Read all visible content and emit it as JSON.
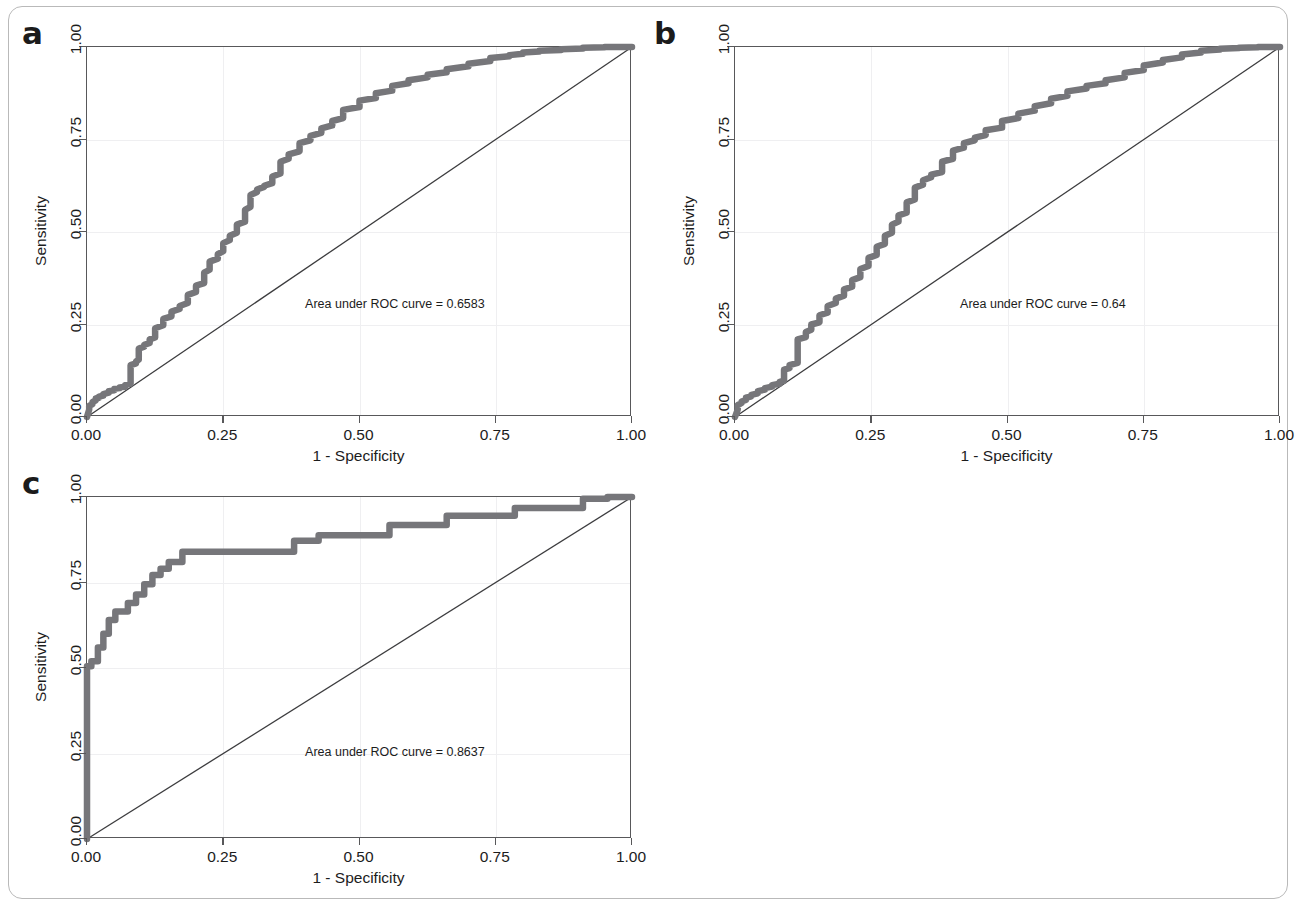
{
  "figure": {
    "panels": [
      {
        "label": "a",
        "auc_text": "Area under ROC curve = 0.6583",
        "auc_value": 0.6583,
        "xlabel": "1 - Specificity",
        "ylabel": "Sensitivity",
        "xticks": [
          "0.00",
          "0.25",
          "0.50",
          "0.75",
          "1.00"
        ],
        "yticks": [
          "0.00",
          "0.25",
          "0.50",
          "0.75",
          "1.00"
        ]
      },
      {
        "label": "b",
        "auc_text": "Area under ROC curve = 0.64",
        "auc_value": 0.64,
        "xlabel": "1 - Specificity",
        "ylabel": "Sensitivity",
        "xticks": [
          "0.00",
          "0.25",
          "0.50",
          "0.75",
          "1.00"
        ],
        "yticks": [
          "0.00",
          "0.25",
          "0.50",
          "0.75",
          "1.00"
        ]
      },
      {
        "label": "c",
        "auc_text": "Area under ROC curve = 0.8637",
        "auc_value": 0.8637,
        "xlabel": "1 - Specificity",
        "ylabel": "Sensitivity",
        "xticks": [
          "0.00",
          "0.25",
          "0.50",
          "0.75",
          "1.00"
        ],
        "yticks": [
          "0.00",
          "0.25",
          "0.50",
          "0.75",
          "1.00"
        ]
      }
    ],
    "colors": {
      "curve": "#76767a",
      "reference_line": "#3c3c3e",
      "axis": "#58585a",
      "grid": "#efeff1",
      "frame_border": "#b9b9b9",
      "text": "#1c1c1c"
    }
  },
  "chart_data": [
    {
      "type": "line",
      "panel": "a",
      "title": "",
      "xlabel": "1 - Specificity",
      "ylabel": "Sensitivity",
      "xlim": [
        0,
        1
      ],
      "ylim": [
        0,
        1
      ],
      "xticks": [
        0,
        0.25,
        0.5,
        0.75,
        1
      ],
      "yticks": [
        0,
        0.25,
        0.5,
        0.75,
        1
      ],
      "grid": true,
      "legend": "none",
      "annotations": [
        "Area under ROC curve = 0.6583"
      ],
      "auc": 0.6583,
      "series": [
        {
          "name": "ROC curve",
          "style": "step",
          "x": [
            0.0,
            0.004,
            0.004,
            0.01,
            0.01,
            0.016,
            0.016,
            0.022,
            0.022,
            0.03,
            0.03,
            0.04,
            0.04,
            0.05,
            0.05,
            0.06,
            0.06,
            0.07,
            0.07,
            0.08,
            0.08,
            0.09,
            0.09,
            0.095,
            0.095,
            0.105,
            0.105,
            0.115,
            0.115,
            0.125,
            0.125,
            0.14,
            0.14,
            0.155,
            0.155,
            0.17,
            0.17,
            0.185,
            0.185,
            0.2,
            0.2,
            0.215,
            0.215,
            0.225,
            0.225,
            0.24,
            0.24,
            0.25,
            0.25,
            0.262,
            0.262,
            0.275,
            0.275,
            0.29,
            0.29,
            0.3,
            0.3,
            0.312,
            0.312,
            0.325,
            0.325,
            0.34,
            0.34,
            0.355,
            0.355,
            0.37,
            0.37,
            0.39,
            0.39,
            0.41,
            0.41,
            0.43,
            0.43,
            0.45,
            0.45,
            0.47,
            0.47,
            0.5,
            0.5,
            0.53,
            0.53,
            0.56,
            0.56,
            0.59,
            0.59,
            0.625,
            0.625,
            0.66,
            0.66,
            0.7,
            0.7,
            0.74,
            0.74,
            0.775,
            0.775,
            0.8,
            0.8,
            0.83,
            0.83,
            0.87,
            0.87,
            0.91,
            0.91,
            0.95,
            0.95,
            1.0
          ],
          "y": [
            0.0,
            0.02,
            0.03,
            0.035,
            0.04,
            0.045,
            0.05,
            0.052,
            0.055,
            0.058,
            0.062,
            0.066,
            0.07,
            0.072,
            0.076,
            0.078,
            0.08,
            0.082,
            0.086,
            0.09,
            0.14,
            0.145,
            0.15,
            0.155,
            0.185,
            0.19,
            0.195,
            0.2,
            0.21,
            0.215,
            0.24,
            0.248,
            0.265,
            0.272,
            0.285,
            0.292,
            0.3,
            0.308,
            0.33,
            0.338,
            0.355,
            0.362,
            0.39,
            0.398,
            0.42,
            0.428,
            0.44,
            0.448,
            0.47,
            0.478,
            0.49,
            0.498,
            0.52,
            0.528,
            0.56,
            0.568,
            0.6,
            0.608,
            0.615,
            0.622,
            0.625,
            0.632,
            0.65,
            0.658,
            0.69,
            0.698,
            0.71,
            0.718,
            0.74,
            0.748,
            0.76,
            0.768,
            0.78,
            0.788,
            0.8,
            0.808,
            0.83,
            0.838,
            0.855,
            0.862,
            0.875,
            0.882,
            0.895,
            0.902,
            0.91,
            0.918,
            0.925,
            0.932,
            0.94,
            0.948,
            0.955,
            0.962,
            0.97,
            0.975,
            0.978,
            0.982,
            0.985,
            0.988,
            0.99,
            0.992,
            0.994,
            0.996,
            0.998,
            0.999,
            1.0,
            1.0
          ]
        },
        {
          "name": "reference diagonal",
          "style": "line",
          "x": [
            0,
            1
          ],
          "y": [
            0,
            1
          ]
        }
      ]
    },
    {
      "type": "line",
      "panel": "b",
      "title": "",
      "xlabel": "1 - Specificity",
      "ylabel": "Sensitivity",
      "xlim": [
        0,
        1
      ],
      "ylim": [
        0,
        1
      ],
      "xticks": [
        0,
        0.25,
        0.5,
        0.75,
        1
      ],
      "yticks": [
        0,
        0.25,
        0.5,
        0.75,
        1
      ],
      "grid": true,
      "legend": "none",
      "annotations": [
        "Area under ROC curve = 0.64"
      ],
      "auc": 0.64,
      "series": [
        {
          "name": "ROC curve",
          "style": "step",
          "x": [
            0.0,
            0.005,
            0.005,
            0.012,
            0.012,
            0.02,
            0.02,
            0.03,
            0.03,
            0.042,
            0.042,
            0.055,
            0.055,
            0.068,
            0.068,
            0.082,
            0.082,
            0.09,
            0.09,
            0.1,
            0.1,
            0.115,
            0.115,
            0.13,
            0.13,
            0.14,
            0.14,
            0.155,
            0.155,
            0.17,
            0.17,
            0.185,
            0.185,
            0.2,
            0.2,
            0.215,
            0.215,
            0.23,
            0.23,
            0.245,
            0.245,
            0.26,
            0.26,
            0.275,
            0.275,
            0.288,
            0.288,
            0.3,
            0.3,
            0.315,
            0.315,
            0.33,
            0.33,
            0.345,
            0.345,
            0.36,
            0.36,
            0.38,
            0.38,
            0.4,
            0.4,
            0.42,
            0.42,
            0.44,
            0.44,
            0.46,
            0.46,
            0.49,
            0.49,
            0.52,
            0.52,
            0.55,
            0.55,
            0.58,
            0.58,
            0.61,
            0.61,
            0.645,
            0.645,
            0.68,
            0.68,
            0.715,
            0.715,
            0.75,
            0.75,
            0.785,
            0.785,
            0.82,
            0.82,
            0.855,
            0.855,
            0.89,
            0.89,
            0.925,
            0.925,
            0.96,
            0.96,
            1.0
          ],
          "y": [
            0.0,
            0.02,
            0.032,
            0.038,
            0.042,
            0.046,
            0.052,
            0.056,
            0.06,
            0.064,
            0.07,
            0.074,
            0.078,
            0.082,
            0.086,
            0.09,
            0.095,
            0.098,
            0.128,
            0.132,
            0.14,
            0.146,
            0.21,
            0.216,
            0.23,
            0.236,
            0.25,
            0.256,
            0.275,
            0.282,
            0.3,
            0.308,
            0.32,
            0.328,
            0.345,
            0.352,
            0.37,
            0.378,
            0.4,
            0.408,
            0.43,
            0.438,
            0.46,
            0.468,
            0.49,
            0.498,
            0.52,
            0.528,
            0.545,
            0.552,
            0.58,
            0.588,
            0.62,
            0.628,
            0.64,
            0.648,
            0.655,
            0.662,
            0.69,
            0.698,
            0.72,
            0.728,
            0.74,
            0.748,
            0.755,
            0.762,
            0.775,
            0.782,
            0.8,
            0.808,
            0.82,
            0.828,
            0.84,
            0.848,
            0.86,
            0.868,
            0.88,
            0.888,
            0.895,
            0.902,
            0.91,
            0.918,
            0.93,
            0.938,
            0.95,
            0.958,
            0.965,
            0.972,
            0.98,
            0.985,
            0.99,
            0.993,
            0.995,
            0.997,
            0.998,
            0.999,
            1.0,
            1.0
          ]
        },
        {
          "name": "reference diagonal",
          "style": "line",
          "x": [
            0,
            1
          ],
          "y": [
            0,
            1
          ]
        }
      ]
    },
    {
      "type": "line",
      "panel": "c",
      "title": "",
      "xlabel": "1 - Specificity",
      "ylabel": "Sensitivity",
      "xlim": [
        0,
        1
      ],
      "ylim": [
        0,
        1
      ],
      "xticks": [
        0,
        0.25,
        0.5,
        0.75,
        1
      ],
      "yticks": [
        0,
        0.25,
        0.5,
        0.75,
        1
      ],
      "grid": true,
      "legend": "none",
      "annotations": [
        "Area under ROC curve = 0.8637"
      ],
      "auc": 0.8637,
      "series": [
        {
          "name": "ROC curve",
          "style": "step",
          "x": [
            0.0,
            0.0,
            0.008,
            0.008,
            0.02,
            0.02,
            0.03,
            0.03,
            0.04,
            0.04,
            0.052,
            0.052,
            0.06,
            0.06,
            0.075,
            0.075,
            0.09,
            0.09,
            0.105,
            0.105,
            0.12,
            0.12,
            0.135,
            0.135,
            0.15,
            0.15,
            0.175,
            0.175,
            0.205,
            0.205,
            0.38,
            0.38,
            0.425,
            0.425,
            0.555,
            0.555,
            0.66,
            0.66,
            0.785,
            0.785,
            0.91,
            0.91,
            0.955,
            0.955,
            1.0
          ],
          "y": [
            0.0,
            0.505,
            0.505,
            0.52,
            0.52,
            0.56,
            0.56,
            0.6,
            0.6,
            0.64,
            0.64,
            0.665,
            0.665,
            0.665,
            0.665,
            0.69,
            0.69,
            0.715,
            0.715,
            0.745,
            0.745,
            0.772,
            0.772,
            0.79,
            0.79,
            0.81,
            0.81,
            0.84,
            0.84,
            0.84,
            0.84,
            0.872,
            0.872,
            0.888,
            0.888,
            0.918,
            0.918,
            0.945,
            0.945,
            0.968,
            0.968,
            0.995,
            0.995,
            1.0,
            1.0
          ]
        },
        {
          "name": "reference diagonal",
          "style": "line",
          "x": [
            0,
            1
          ],
          "y": [
            0,
            1
          ]
        }
      ]
    }
  ]
}
